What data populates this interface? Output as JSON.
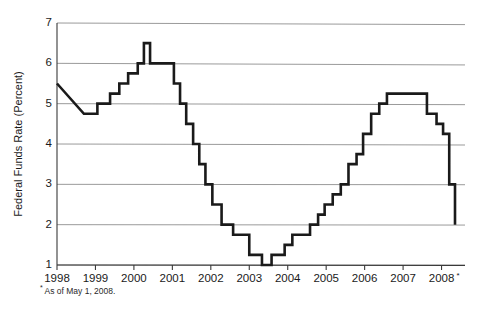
{
  "chart_data": {
    "type": "line",
    "title": "",
    "subtitle": "",
    "xlabel": "",
    "ylabel": "Federal Funds Rate (Percent)",
    "xlim": [
      1998.0,
      2008.35
    ],
    "ylim": [
      1,
      7
    ],
    "grid": true,
    "legend": null,
    "line_style": "step",
    "y_ticks": [
      1,
      2,
      3,
      4,
      5,
      6,
      7
    ],
    "y_tick_labels": [
      "1",
      "2",
      "3",
      "4",
      "5",
      "6",
      "7"
    ],
    "x_ticks": [
      1998,
      1999,
      2000,
      2001,
      2002,
      2003,
      2004,
      2005,
      2006,
      2007,
      2008
    ],
    "x_tick_labels": [
      "1998",
      "1999",
      "2000",
      "2001",
      "2002",
      "2003",
      "2004",
      "2005",
      "2006",
      "2007",
      "2008"
    ],
    "x_last_tick_superscript": "*",
    "annotations": [
      {
        "name": "footnote",
        "marker": "*",
        "text": "As of May 1, 2008."
      }
    ],
    "series": [
      {
        "name": "Federal Funds Rate",
        "color": "#1a1a1a",
        "x": [
          1998.0,
          1998.7,
          1998.78,
          1999.05,
          1999.12,
          1999.38,
          1999.45,
          1999.62,
          1999.7,
          1999.85,
          1999.92,
          2000.1,
          2000.17,
          2000.26,
          2000.33,
          2000.42,
          2000.5,
          2000.96,
          2001.04,
          2001.12,
          2001.2,
          2001.28,
          2001.36,
          2001.46,
          2001.54,
          2001.62,
          2001.7,
          2001.78,
          2001.86,
          2001.96,
          2002.04,
          2002.2,
          2002.28,
          2002.5,
          2002.58,
          2002.92,
          2003.0,
          2003.25,
          2003.33,
          2003.5,
          2003.58,
          2003.83,
          2003.92,
          2004.04,
          2004.12,
          2004.5,
          2004.58,
          2004.71,
          2004.79,
          2004.88,
          2004.96,
          2005.08,
          2005.17,
          2005.29,
          2005.38,
          2005.5,
          2005.58,
          2005.71,
          2005.79,
          2005.88,
          2005.96,
          2006.08,
          2006.17,
          2006.29,
          2006.38,
          2006.5,
          2006.58,
          2007.54,
          2007.62,
          2007.79,
          2007.87,
          2007.96,
          2008.04,
          2008.12,
          2008.2,
          2008.28,
          2008.35
        ],
        "y": [
          5.5,
          4.75,
          4.75,
          5.0,
          5.0,
          5.25,
          5.25,
          5.5,
          5.5,
          5.75,
          5.75,
          6.0,
          6.0,
          6.5,
          6.5,
          6.0,
          6.0,
          6.0,
          5.5,
          5.5,
          5.0,
          5.0,
          4.5,
          4.5,
          4.0,
          4.0,
          3.5,
          3.5,
          3.0,
          3.0,
          2.5,
          2.5,
          2.0,
          2.0,
          1.75,
          1.75,
          1.25,
          1.25,
          1.0,
          1.0,
          1.25,
          1.25,
          1.5,
          1.5,
          1.75,
          1.75,
          2.0,
          2.0,
          2.25,
          2.25,
          2.5,
          2.5,
          2.75,
          2.75,
          3.0,
          3.0,
          3.5,
          3.5,
          3.75,
          3.75,
          4.25,
          4.25,
          4.75,
          4.75,
          5.0,
          5.0,
          5.25,
          5.25,
          4.75,
          4.75,
          4.5,
          4.5,
          4.25,
          4.25,
          3.0,
          3.0,
          2.0
        ]
      }
    ]
  },
  "axis": {
    "y_title": "Federal Funds Rate (Percent)"
  },
  "footnote": {
    "marker": "*",
    "text": "As of May 1, 2008."
  },
  "colors": {
    "line": "#1a1a1a",
    "grid": "#8e8e8e",
    "axis": "#3a3a3a",
    "background": "#ffffff",
    "text": "#1a1a1a"
  }
}
